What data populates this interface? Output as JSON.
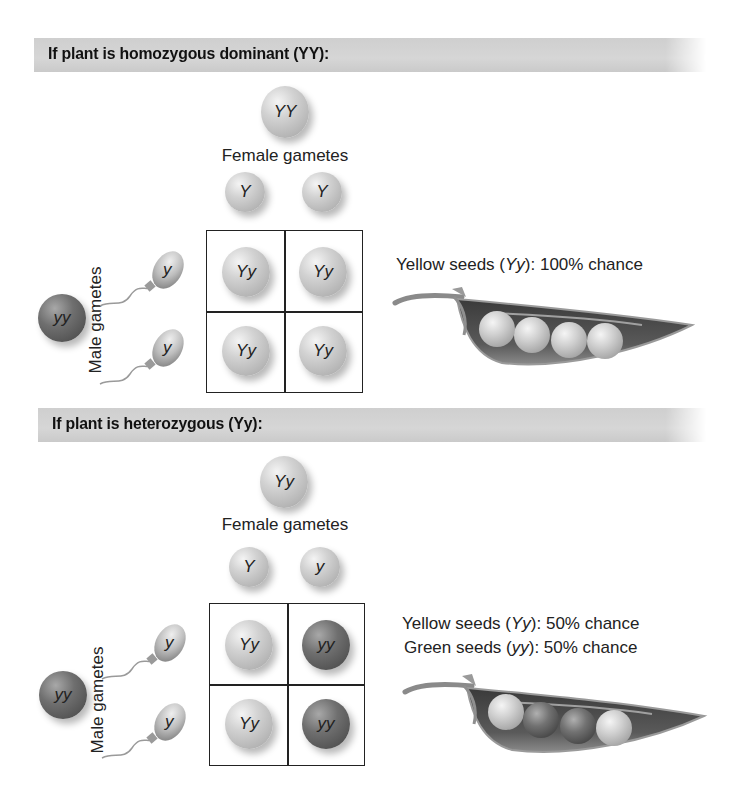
{
  "sections": [
    {
      "id": "homozygous",
      "header": "If plant is homozygous dominant (YY):",
      "female_parent": "YY",
      "female_gametes_label": "Female gametes",
      "female_gametes": [
        "Y",
        "Y"
      ],
      "male_parent": "yy",
      "male_gametes_label": "Male gametes",
      "male_gametes": [
        "y",
        "y"
      ],
      "punnett": [
        [
          "Yy",
          "Yy"
        ],
        [
          "Yy",
          "Yy"
        ]
      ],
      "results": [
        {
          "label": "Yellow seeds",
          "genotype": "Yy",
          "chance": "100% chance"
        }
      ],
      "pod_peas": [
        "yellow",
        "yellow",
        "yellow",
        "yellow"
      ]
    },
    {
      "id": "heterozygous",
      "header": "If plant is heterozygous (Yy):",
      "female_parent": "Yy",
      "female_gametes_label": "Female gametes",
      "female_gametes": [
        "Y",
        "y"
      ],
      "male_parent": "yy",
      "male_gametes_label": "Male gametes",
      "male_gametes": [
        "y",
        "y"
      ],
      "punnett": [
        [
          "Yy",
          "yy"
        ],
        [
          "Yy",
          "yy"
        ]
      ],
      "results": [
        {
          "label": "Yellow seeds",
          "genotype": "Yy",
          "chance": "50% chance"
        },
        {
          "label": "Green seeds",
          "genotype": "yy",
          "chance": "50% chance"
        }
      ],
      "pod_peas": [
        "yellow",
        "green",
        "green",
        "yellow"
      ]
    }
  ],
  "colors": {
    "header_bar": "#d2d2d2",
    "yellow_pea": "#c8c8c8",
    "green_pea": "#5a5a5a",
    "grid_line": "#222222"
  }
}
